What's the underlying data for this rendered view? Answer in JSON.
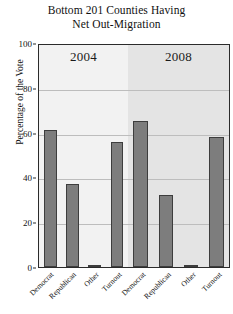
{
  "chart_data": {
    "type": "bar",
    "title": "Bottom 201 Counties Having Net Out-Migration",
    "title_lines": [
      "Bottom 201 Counties Having",
      "Net Out-Migration"
    ],
    "xlabel": "",
    "ylabel": "Percentage of the Vote",
    "ylim": [
      0,
      100
    ],
    "yticks": [
      0,
      20,
      40,
      60,
      80,
      100
    ],
    "ytick_labels": [
      "0",
      "20",
      "40",
      "60",
      "80",
      "100"
    ],
    "grid": true,
    "legend": "none",
    "categories": [
      "Democrat",
      "Republican",
      "Other",
      "Turnout"
    ],
    "panels": [
      {
        "label": "2004",
        "background": "#f2f2f2",
        "categories": [
          "Democrat",
          "Republican",
          "Other",
          "Turnout"
        ],
        "values": [
          61,
          37,
          1,
          56
        ]
      },
      {
        "label": "2008",
        "background": "#e4e4e4",
        "categories": [
          "Democrat",
          "Republican",
          "Other",
          "Turnout"
        ],
        "values": [
          65,
          32,
          1,
          58
        ]
      }
    ],
    "series": [
      {
        "name": "2004",
        "values": [
          61,
          37,
          1,
          56
        ]
      },
      {
        "name": "2008",
        "values": [
          65,
          32,
          1,
          58
        ]
      }
    ],
    "bar_color": "#7d7d7d",
    "bar_edge_color": "#3d3d3d",
    "axis_color": "#2b2b2b",
    "gridline_color": "#bdbdbd"
  }
}
